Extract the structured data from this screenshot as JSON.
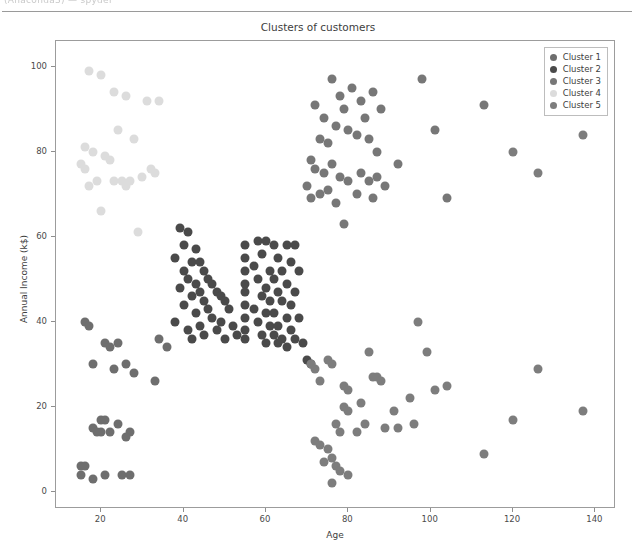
{
  "scan": {
    "top_artifact_text": "(Anaconda3) — spyder"
  },
  "chart_data": {
    "type": "scatter",
    "title": "Clusters of customers",
    "xlabel": "Age",
    "ylabel": "Annual Income (k$)",
    "xlim": [
      9,
      145
    ],
    "ylim": [
      -4,
      106
    ],
    "xticks": [
      20,
      40,
      60,
      80,
      100,
      120,
      140
    ],
    "yticks": [
      0,
      20,
      40,
      60,
      80,
      100
    ],
    "grid": false,
    "legend_position": "upper right",
    "marker_size_px": 9,
    "series": [
      {
        "name": "Cluster 1",
        "color": "#6e6e6e",
        "points": [
          [
            16,
            40
          ],
          [
            17,
            39
          ],
          [
            21,
            35
          ],
          [
            22,
            34
          ],
          [
            24,
            35
          ],
          [
            18,
            30
          ],
          [
            26,
            30
          ],
          [
            23,
            29
          ],
          [
            28,
            28
          ],
          [
            20,
            17
          ],
          [
            21,
            17
          ],
          [
            24,
            16
          ],
          [
            18,
            15
          ],
          [
            19,
            14
          ],
          [
            20,
            14
          ],
          [
            22,
            14
          ],
          [
            27,
            14
          ],
          [
            26,
            13
          ],
          [
            15,
            6
          ],
          [
            16,
            6
          ],
          [
            15,
            4
          ],
          [
            18,
            3
          ],
          [
            21,
            4
          ],
          [
            25,
            4
          ],
          [
            27,
            4
          ],
          [
            34,
            36
          ],
          [
            33,
            26
          ],
          [
            36,
            34
          ]
        ]
      },
      {
        "name": "Cluster 2",
        "color": "#4a4a4a",
        "points": [
          [
            39,
            62
          ],
          [
            41,
            61
          ],
          [
            40,
            58
          ],
          [
            43,
            57
          ],
          [
            38,
            55
          ],
          [
            42,
            54
          ],
          [
            44,
            54
          ],
          [
            40,
            52
          ],
          [
            45,
            52
          ],
          [
            41,
            50
          ],
          [
            46,
            50
          ],
          [
            43,
            49
          ],
          [
            47,
            49
          ],
          [
            39,
            48
          ],
          [
            44,
            47
          ],
          [
            48,
            47
          ],
          [
            42,
            46
          ],
          [
            49,
            46
          ],
          [
            45,
            45
          ],
          [
            50,
            45
          ],
          [
            40,
            44
          ],
          [
            46,
            43
          ],
          [
            51,
            43
          ],
          [
            43,
            42
          ],
          [
            47,
            41
          ],
          [
            38,
            40
          ],
          [
            49,
            40
          ],
          [
            44,
            39
          ],
          [
            52,
            39
          ],
          [
            41,
            38
          ],
          [
            48,
            38
          ],
          [
            45,
            37
          ],
          [
            53,
            37
          ],
          [
            42,
            36
          ],
          [
            50,
            36
          ],
          [
            55,
            58
          ],
          [
            55,
            55
          ],
          [
            55,
            52
          ],
          [
            55,
            49
          ],
          [
            55,
            47
          ],
          [
            55,
            44
          ],
          [
            55,
            41
          ],
          [
            55,
            38
          ],
          [
            55,
            36
          ],
          [
            58,
            59
          ],
          [
            60,
            59
          ],
          [
            62,
            58
          ],
          [
            65,
            58
          ],
          [
            67,
            58
          ],
          [
            59,
            56
          ],
          [
            63,
            55
          ],
          [
            66,
            54
          ],
          [
            57,
            53
          ],
          [
            61,
            52
          ],
          [
            64,
            52
          ],
          [
            68,
            52
          ],
          [
            58,
            50
          ],
          [
            62,
            50
          ],
          [
            65,
            49
          ],
          [
            60,
            48
          ],
          [
            63,
            47
          ],
          [
            67,
            47
          ],
          [
            59,
            46
          ],
          [
            61,
            45
          ],
          [
            64,
            45
          ],
          [
            66,
            44
          ],
          [
            57,
            43
          ],
          [
            60,
            42
          ],
          [
            62,
            42
          ],
          [
            65,
            41
          ],
          [
            68,
            41
          ],
          [
            58,
            40
          ],
          [
            61,
            39
          ],
          [
            63,
            39
          ],
          [
            66,
            38
          ],
          [
            59,
            37
          ],
          [
            62,
            37
          ],
          [
            64,
            36
          ],
          [
            67,
            36
          ],
          [
            60,
            35
          ],
          [
            63,
            35
          ],
          [
            65,
            34
          ],
          [
            69,
            35
          ],
          [
            70,
            31
          ],
          [
            71,
            30
          ]
        ]
      },
      {
        "name": "Cluster 3",
        "color": "#777777",
        "points": [
          [
            72,
            91
          ],
          [
            74,
            88
          ],
          [
            76,
            97
          ],
          [
            78,
            93
          ],
          [
            79,
            90
          ],
          [
            81,
            95
          ],
          [
            83,
            92
          ],
          [
            84,
            88
          ],
          [
            86,
            94
          ],
          [
            88,
            90
          ],
          [
            77,
            86
          ],
          [
            80,
            85
          ],
          [
            82,
            84
          ],
          [
            85,
            83
          ],
          [
            73,
            83
          ],
          [
            75,
            82
          ],
          [
            87,
            80
          ],
          [
            71,
            78
          ],
          [
            72,
            76
          ],
          [
            74,
            75
          ],
          [
            76,
            77
          ],
          [
            78,
            74
          ],
          [
            80,
            73
          ],
          [
            83,
            75
          ],
          [
            85,
            73
          ],
          [
            87,
            74
          ],
          [
            89,
            72
          ],
          [
            92,
            77
          ],
          [
            70,
            72
          ],
          [
            73,
            70
          ],
          [
            75,
            71
          ],
          [
            71,
            69
          ],
          [
            77,
            68
          ],
          [
            82,
            70
          ],
          [
            86,
            69
          ],
          [
            79,
            63
          ],
          [
            98,
            97
          ],
          [
            101,
            85
          ],
          [
            104,
            69
          ],
          [
            113,
            91
          ]
        ]
      },
      {
        "name": "Cluster 4",
        "color": "#dcdcdc",
        "points": [
          [
            17,
            99
          ],
          [
            20,
            98
          ],
          [
            23,
            94
          ],
          [
            26,
            93
          ],
          [
            31,
            92
          ],
          [
            34,
            92
          ],
          [
            16,
            81
          ],
          [
            18,
            80
          ],
          [
            15,
            77
          ],
          [
            16,
            76
          ],
          [
            21,
            79
          ],
          [
            22,
            78
          ],
          [
            24,
            85
          ],
          [
            28,
            83
          ],
          [
            33,
            75
          ],
          [
            19,
            73
          ],
          [
            23,
            73
          ],
          [
            25,
            73
          ],
          [
            27,
            73
          ],
          [
            30,
            74
          ],
          [
            32,
            76
          ],
          [
            17,
            72
          ],
          [
            20,
            66
          ],
          [
            29,
            61
          ],
          [
            26,
            72
          ]
        ]
      },
      {
        "name": "Cluster 5",
        "color": "#7d7d7d",
        "points": [
          [
            71,
            30
          ],
          [
            72,
            29
          ],
          [
            75,
            31
          ],
          [
            76,
            30
          ],
          [
            73,
            26
          ],
          [
            85,
            33
          ],
          [
            86,
            27
          ],
          [
            87,
            27
          ],
          [
            88,
            26
          ],
          [
            83,
            21
          ],
          [
            79,
            25
          ],
          [
            80,
            24
          ],
          [
            79,
            20
          ],
          [
            80,
            19
          ],
          [
            84,
            16
          ],
          [
            77,
            16
          ],
          [
            78,
            14
          ],
          [
            82,
            14
          ],
          [
            89,
            15
          ],
          [
            95,
            22
          ],
          [
            91,
            19
          ],
          [
            97,
            40
          ],
          [
            99,
            33
          ],
          [
            101,
            24
          ],
          [
            104,
            25
          ],
          [
            96,
            16
          ],
          [
            72,
            12
          ],
          [
            73,
            11
          ],
          [
            75,
            10
          ],
          [
            76,
            8
          ],
          [
            74,
            7
          ],
          [
            77,
            6
          ],
          [
            78,
            5
          ],
          [
            80,
            4
          ],
          [
            76,
            2
          ],
          [
            92,
            15
          ],
          [
            113,
            9
          ],
          [
            120,
            17
          ],
          [
            126,
            29
          ],
          [
            137,
            19
          ],
          [
            120,
            80
          ],
          [
            126,
            75
          ],
          [
            137,
            84
          ]
        ]
      }
    ]
  }
}
